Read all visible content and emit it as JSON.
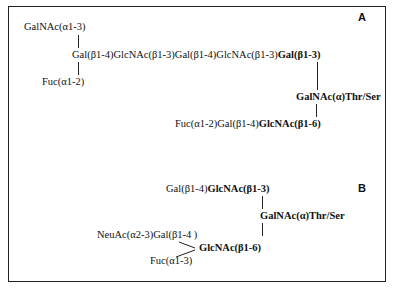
{
  "panels": {
    "A": {
      "label": "A",
      "branch_top": "GalNAc(α1-3)",
      "main_chain_plain": "Gal(β1-4)GlcNAc(β1-3)Gal(β1-4)GlcNAc(β1-3)",
      "main_chain_bold": "Gal(β1-3)",
      "branch_bottom": "Fuc(α1-2)",
      "core": "GalNAc(α)Thr/Ser",
      "lower_chain_plain": "Fuc(α1-2)Gal(β1-4)",
      "lower_chain_bold": "GlcNAc(β1-6)"
    },
    "B": {
      "label": "B",
      "upper_chain_plain": "Gal(β1-4)",
      "upper_chain_bold": "GlcNAc(β1-3)",
      "core": "GalNAc(α)Thr/Ser",
      "branch_upper": "NeuAc(α2-3)Gal(β1-4 )",
      "branch_lower": "Fuc(α1-3)",
      "lower_bold": "GlcNAc(β1-6)"
    }
  }
}
